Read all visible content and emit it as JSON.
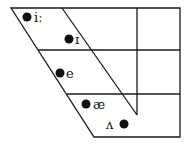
{
  "diagram": {
    "type": "vowel-trapezoid",
    "vowels": [
      {
        "symbol": "iː",
        "x": 27,
        "y": 17
      },
      {
        "symbol": "ɪ",
        "x": 69,
        "y": 39
      },
      {
        "symbol": "e",
        "x": 60,
        "y": 73
      },
      {
        "symbol": "æ",
        "x": 86,
        "y": 104
      },
      {
        "symbol": "ʌ",
        "x": 124,
        "y": 124
      }
    ]
  }
}
